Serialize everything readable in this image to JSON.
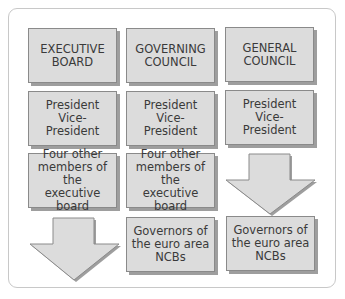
{
  "diagram": {
    "columns": [
      {
        "name": "executive-board",
        "cells": [
          {
            "type": "box",
            "text": "EXECUTIVE\nBOARD"
          },
          {
            "type": "box",
            "text": "President\nVice-President"
          },
          {
            "type": "box",
            "text": "Four other\nmembers of the\nexecutive board"
          },
          {
            "type": "arrow-down"
          }
        ]
      },
      {
        "name": "governing-council",
        "cells": [
          {
            "type": "box",
            "text": "GOVERNING\nCOUNCIL"
          },
          {
            "type": "box",
            "text": "President\nVice-President"
          },
          {
            "type": "box",
            "text": "Four other\nmembers of the\nexecutive board"
          },
          {
            "type": "box",
            "text": "Governors of\nthe euro area\nNCBs"
          }
        ]
      },
      {
        "name": "general-council",
        "cells": [
          {
            "type": "box",
            "text": "GENERAL\nCOUNCIL"
          },
          {
            "type": "box",
            "text": "President\nVice-President"
          },
          {
            "type": "arrow-down"
          },
          {
            "type": "box",
            "text": "Governors of\nthe euro area\nNCBs"
          }
        ]
      }
    ],
    "colors": {
      "box_fill": "#dcdcdc",
      "box_border": "#8a8a8a",
      "shadow": "#9e9e9e",
      "text": "#3a3a3a",
      "frame_border": "#c8c8c8"
    }
  }
}
